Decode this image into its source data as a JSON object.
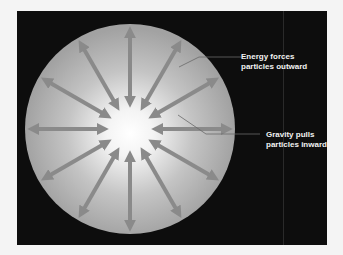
{
  "diagram": {
    "labels": {
      "energy": [
        "Energy forces",
        "particles outward"
      ],
      "gravity": [
        "Gravity pulls",
        "particles inward"
      ]
    },
    "colors": {
      "background": "#0d0d0d",
      "sphere_center": "#ffffff",
      "sphere_edge": "#a8a8a8",
      "arrow": "#8a8a8a",
      "leader_line": "#5a5a5a",
      "label_text": "#f2f2f2"
    },
    "arrow_count": 12,
    "arrow_style": "double-headed"
  }
}
